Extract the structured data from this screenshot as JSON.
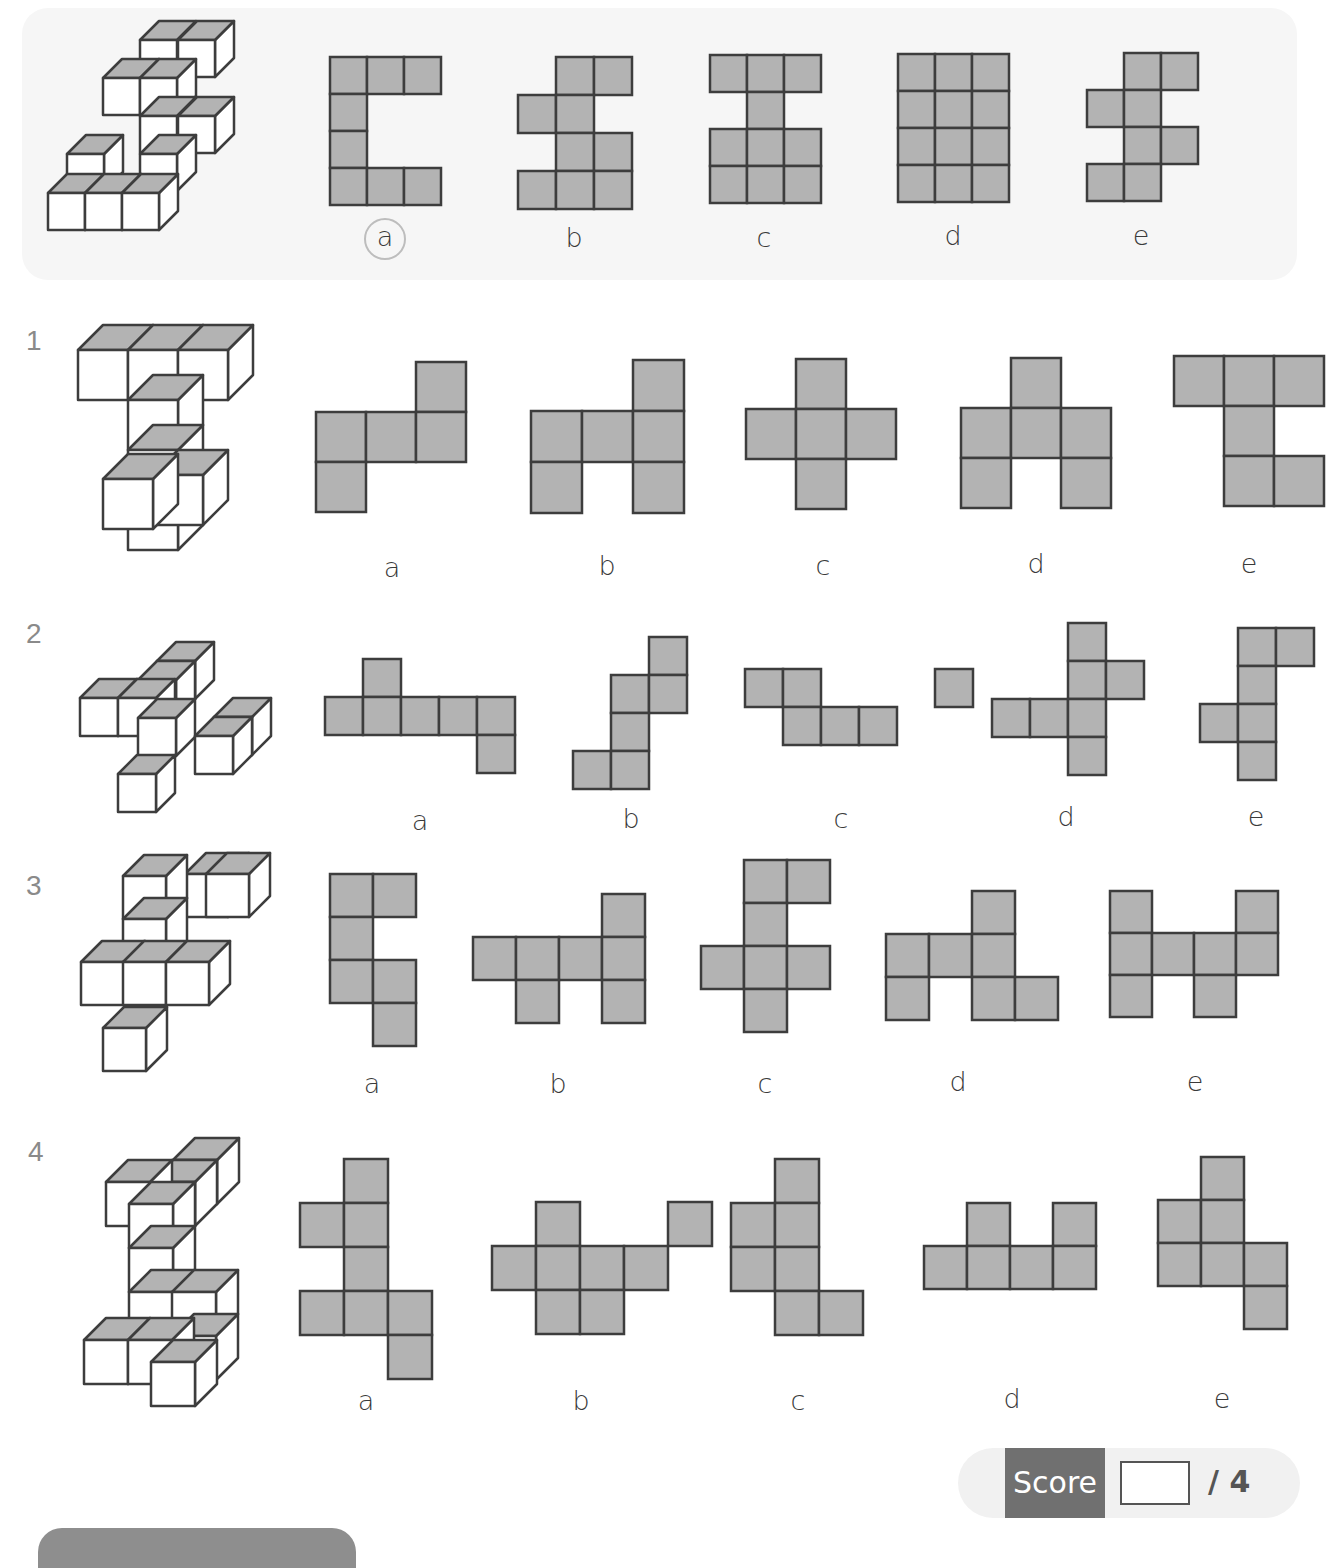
{
  "style": {
    "net_fill": "#b3b3b3",
    "net_stroke": "#3d3d3d",
    "cube_top": "#b3b3b3",
    "cube_face": "#ffffff"
  },
  "questions": [
    {
      "id": "example",
      "number": "",
      "answer": "a",
      "options": [
        {
          "label": "a",
          "label_pos": [
            385,
            222
          ],
          "circled": true,
          "origin": [
            330,
            57
          ],
          "cell": 37,
          "cells": [
            [
              0,
              0
            ],
            [
              1,
              0
            ],
            [
              2,
              0
            ],
            [
              0,
              1
            ],
            [
              0,
              2
            ],
            [
              0,
              3
            ],
            [
              1,
              3
            ],
            [
              2,
              3
            ]
          ]
        },
        {
          "label": "b",
          "label_pos": [
            574,
            222
          ],
          "origin": [
            518,
            57
          ],
          "cell": 38,
          "cells": [
            [
              1,
              0
            ],
            [
              2,
              0
            ],
            [
              0,
              1
            ],
            [
              1,
              1
            ],
            [
              1,
              2
            ],
            [
              2,
              2
            ],
            [
              0,
              3
            ],
            [
              1,
              3
            ],
            [
              2,
              3
            ]
          ]
        },
        {
          "label": "c",
          "label_pos": [
            764,
            222
          ],
          "origin": [
            710,
            55
          ],
          "cell": 37,
          "cells": [
            [
              0,
              0
            ],
            [
              1,
              0
            ],
            [
              2,
              0
            ],
            [
              1,
              1
            ],
            [
              0,
              2
            ],
            [
              1,
              2
            ],
            [
              2,
              2
            ],
            [
              0,
              3
            ],
            [
              1,
              3
            ],
            [
              2,
              3
            ]
          ]
        },
        {
          "label": "d",
          "label_pos": [
            953,
            220
          ],
          "origin": [
            898,
            54
          ],
          "cell": 37,
          "cells": [
            [
              0,
              0
            ],
            [
              1,
              0
            ],
            [
              2,
              0
            ],
            [
              0,
              1
            ],
            [
              1,
              1
            ],
            [
              2,
              1
            ],
            [
              0,
              2
            ],
            [
              1,
              2
            ],
            [
              2,
              2
            ],
            [
              0,
              3
            ],
            [
              1,
              3
            ],
            [
              2,
              3
            ]
          ]
        },
        {
          "label": "e",
          "label_pos": [
            1141,
            220
          ],
          "origin": [
            1087,
            53
          ],
          "cell": 37,
          "cells": [
            [
              1,
              0
            ],
            [
              2,
              0
            ],
            [
              0,
              1
            ],
            [
              1,
              1
            ],
            [
              1,
              2
            ],
            [
              2,
              2
            ],
            [
              0,
              3
            ],
            [
              1,
              3
            ]
          ]
        }
      ]
    },
    {
      "id": "q1",
      "number": "1",
      "number_pos": [
        26,
        325
      ],
      "options": [
        {
          "label": "a",
          "label_pos": [
            392,
            552
          ],
          "origin": [
            316,
            362
          ],
          "cell": 50,
          "cells": [
            [
              2,
              0
            ],
            [
              0,
              1
            ],
            [
              1,
              1
            ],
            [
              2,
              1
            ],
            [
              0,
              2
            ]
          ]
        },
        {
          "label": "b",
          "label_pos": [
            607,
            550
          ],
          "origin": [
            531,
            360
          ],
          "cell": 51,
          "cells": [
            [
              2,
              0
            ],
            [
              0,
              1
            ],
            [
              1,
              1
            ],
            [
              2,
              1
            ],
            [
              0,
              2
            ],
            [
              2,
              2
            ]
          ]
        },
        {
          "label": "c",
          "label_pos": [
            823,
            550
          ],
          "origin": [
            746,
            359
          ],
          "cell": 50,
          "cells": [
            [
              1,
              0
            ],
            [
              0,
              1
            ],
            [
              1,
              1
            ],
            [
              2,
              1
            ],
            [
              1,
              2
            ]
          ]
        },
        {
          "label": "d",
          "label_pos": [
            1036,
            548
          ],
          "origin": [
            961,
            358
          ],
          "cell": 50,
          "cells": [
            [
              1,
              0
            ],
            [
              0,
              1
            ],
            [
              1,
              1
            ],
            [
              2,
              1
            ],
            [
              0,
              2
            ],
            [
              2,
              2
            ]
          ]
        },
        {
          "label": "e",
          "label_pos": [
            1249,
            548
          ],
          "origin": [
            1174,
            356
          ],
          "cell": 50,
          "cells": [
            [
              0,
              0
            ],
            [
              1,
              0
            ],
            [
              2,
              0
            ],
            [
              1,
              1
            ],
            [
              1,
              2
            ],
            [
              2,
              2
            ]
          ]
        }
      ]
    },
    {
      "id": "q2",
      "number": "2",
      "number_pos": [
        26,
        618
      ],
      "options": [
        {
          "label": "a",
          "label_pos": [
            420,
            805
          ],
          "origin": [
            325,
            659
          ],
          "cell": 38,
          "cells": [
            [
              1,
              0
            ],
            [
              0,
              1
            ],
            [
              1,
              1
            ],
            [
              2,
              1
            ],
            [
              3,
              1
            ],
            [
              4,
              1
            ],
            [
              4,
              2
            ]
          ]
        },
        {
          "label": "b",
          "label_pos": [
            631,
            803
          ],
          "origin": [
            573,
            637
          ],
          "cell": 38,
          "cells": [
            [
              2,
              0
            ],
            [
              1,
              1
            ],
            [
              2,
              1
            ],
            [
              1,
              2
            ],
            [
              0,
              3
            ],
            [
              1,
              3
            ]
          ]
        },
        {
          "label": "c",
          "label_pos": [
            841,
            803
          ],
          "origin": [
            745,
            669
          ],
          "cell": 38,
          "cells": [
            [
              0,
              0
            ],
            [
              1,
              0
            ],
            [
              5,
              0
            ],
            [
              1,
              1
            ],
            [
              2,
              1
            ],
            [
              3,
              1
            ]
          ]
        },
        {
          "label": "d",
          "label_pos": [
            1066,
            801
          ],
          "origin": [
            992,
            623
          ],
          "cell": 38,
          "cells": [
            [
              2,
              0
            ],
            [
              2,
              1
            ],
            [
              3,
              1
            ],
            [
              0,
              2
            ],
            [
              1,
              2
            ],
            [
              2,
              2
            ],
            [
              2,
              3
            ]
          ]
        },
        {
          "label": "e",
          "label_pos": [
            1256,
            801
          ],
          "origin": [
            1200,
            628
          ],
          "cell": 38,
          "cells": [
            [
              1,
              0
            ],
            [
              2,
              0
            ],
            [
              1,
              1
            ],
            [
              0,
              2
            ],
            [
              1,
              2
            ],
            [
              1,
              3
            ]
          ]
        }
      ]
    },
    {
      "id": "q3",
      "number": "3",
      "number_pos": [
        26,
        870
      ],
      "options": [
        {
          "label": "a",
          "label_pos": [
            372,
            1068
          ],
          "origin": [
            330,
            874
          ],
          "cell": 43,
          "cells": [
            [
              0,
              0
            ],
            [
              1,
              0
            ],
            [
              0,
              1
            ],
            [
              0,
              2
            ],
            [
              1,
              2
            ],
            [
              1,
              3
            ]
          ]
        },
        {
          "label": "b",
          "label_pos": [
            558,
            1068
          ],
          "origin": [
            473,
            894
          ],
          "cell": 43,
          "cells": [
            [
              3,
              0
            ],
            [
              0,
              1
            ],
            [
              1,
              1
            ],
            [
              2,
              1
            ],
            [
              3,
              1
            ],
            [
              1,
              2
            ],
            [
              3,
              2
            ]
          ]
        },
        {
          "label": "c",
          "label_pos": [
            765,
            1068
          ],
          "origin": [
            701,
            860
          ],
          "cell": 43,
          "cells": [
            [
              1,
              0
            ],
            [
              2,
              0
            ],
            [
              1,
              1
            ],
            [
              0,
              2
            ],
            [
              1,
              2
            ],
            [
              2,
              2
            ],
            [
              1,
              3
            ]
          ]
        },
        {
          "label": "d",
          "label_pos": [
            958,
            1066
          ],
          "origin": [
            886,
            891
          ],
          "cell": 43,
          "cells": [
            [
              2,
              0
            ],
            [
              0,
              1
            ],
            [
              1,
              1
            ],
            [
              2,
              1
            ],
            [
              0,
              2
            ],
            [
              2,
              2
            ],
            [
              3,
              2
            ]
          ]
        },
        {
          "label": "e",
          "label_pos": [
            1195,
            1066
          ],
          "origin": [
            1110,
            891
          ],
          "cell": 42,
          "cells": [
            [
              0,
              0
            ],
            [
              3,
              0
            ],
            [
              0,
              1
            ],
            [
              1,
              1
            ],
            [
              2,
              1
            ],
            [
              3,
              1
            ],
            [
              0,
              2
            ],
            [
              2,
              2
            ]
          ]
        }
      ]
    },
    {
      "id": "q4",
      "number": "4",
      "number_pos": [
        28,
        1136
      ],
      "options": [
        {
          "label": "a",
          "label_pos": [
            366,
            1385
          ],
          "origin": [
            300,
            1159
          ],
          "cell": 44,
          "cells": [
            [
              1,
              0
            ],
            [
              0,
              1
            ],
            [
              1,
              1
            ],
            [
              1,
              2
            ],
            [
              0,
              3
            ],
            [
              1,
              3
            ],
            [
              2,
              3
            ],
            [
              2,
              4
            ]
          ]
        },
        {
          "label": "b",
          "label_pos": [
            581,
            1385
          ],
          "origin": [
            492,
            1202
          ],
          "cell": 44,
          "cells": [
            [
              1,
              0
            ],
            [
              4,
              0
            ],
            [
              0,
              1
            ],
            [
              1,
              1
            ],
            [
              2,
              1
            ],
            [
              3,
              1
            ],
            [
              1,
              2
            ],
            [
              2,
              2
            ]
          ]
        },
        {
          "label": "c",
          "label_pos": [
            798,
            1385
          ],
          "origin": [
            731,
            1159
          ],
          "cell": 44,
          "cells": [
            [
              1,
              0
            ],
            [
              0,
              1
            ],
            [
              1,
              1
            ],
            [
              0,
              2
            ],
            [
              1,
              2
            ],
            [
              1,
              3
            ],
            [
              2,
              3
            ]
          ]
        },
        {
          "label": "d",
          "label_pos": [
            1012,
            1383
          ],
          "origin": [
            924,
            1203
          ],
          "cell": 43,
          "cells": [
            [
              1,
              0
            ],
            [
              3,
              0
            ],
            [
              0,
              1
            ],
            [
              1,
              1
            ],
            [
              2,
              1
            ],
            [
              3,
              1
            ]
          ]
        },
        {
          "label": "e",
          "label_pos": [
            1222,
            1383
          ],
          "origin": [
            1158,
            1157
          ],
          "cell": 43,
          "cells": [
            [
              1,
              0
            ],
            [
              0,
              1
            ],
            [
              1,
              1
            ],
            [
              0,
              2
            ],
            [
              1,
              2
            ],
            [
              2,
              2
            ],
            [
              2,
              3
            ]
          ]
        }
      ]
    }
  ],
  "score": {
    "label": "Score",
    "value": "",
    "total": "/ 4"
  }
}
